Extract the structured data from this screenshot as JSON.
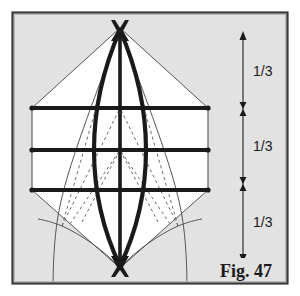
{
  "figure": {
    "caption": "Fig. 47",
    "background_color": "#e2e2e2",
    "interior_color": "#ffffff",
    "frame_color": "#3a3a3a",
    "ink_color": "#1a1a1a",
    "thin_line_color": "#555555",
    "dashed_line_color": "#6a6a6a"
  },
  "scale_bar": {
    "name": "thirds-scale",
    "total_label": "1",
    "divisions": 3,
    "segment_labels": [
      "1/3",
      "1/3",
      "1/3"
    ],
    "top_marker": "arrowhead-up",
    "bottom_marker": "arrowhead-down",
    "tick_marker": "double-arrowhead",
    "axis_x": 243,
    "axis_top_y": 34,
    "axis_bottom_y": 260,
    "tick_ys": [
      109,
      184
    ],
    "label_ys": [
      71,
      146,
      222
    ]
  },
  "diagram": {
    "name": "lens-vesica-grid-construction",
    "apex_top": {
      "x": 120,
      "y": 28
    },
    "apex_bottom": {
      "x": 120,
      "y": 268
    },
    "grid_rows_y": [
      108,
      150,
      190
    ],
    "grid_row_left_x": 32,
    "grid_row_right_x": 208,
    "vertical_curve_left_x": 96,
    "vertical_curve_right_x": 144,
    "marker_top": "bowtie-x-marker",
    "marker_bottom": "bowtie-x-marker",
    "node_dot_count": 12,
    "dashed_line_count": 8,
    "envelope_sides": 2
  }
}
